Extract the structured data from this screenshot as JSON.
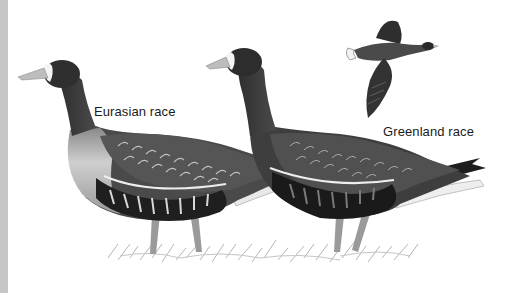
{
  "illustration": {
    "subject": "White-fronted geese",
    "labels": {
      "eurasian": "Eurasian race",
      "greenland": "Greenland race"
    },
    "colors": {
      "background": "#ffffff",
      "left_strip": "#c6c6c6",
      "body_dark": "#3a3a3a",
      "body_mid": "#6a6a6a",
      "breast_light": "#b8b8b8",
      "belly_black": "#1e1e1e",
      "white_front": "#f4f4f4",
      "bill": "#bdbdbd",
      "legs": "#9a9a9a",
      "grass": "#a8a8a8"
    }
  }
}
